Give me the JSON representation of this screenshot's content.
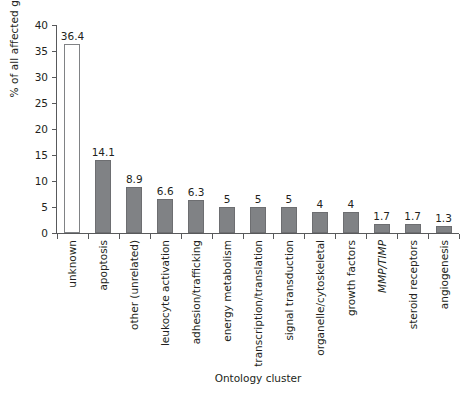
{
  "chart_data": {
    "type": "bar",
    "title": "",
    "xlabel": "Ontology cluster",
    "ylabel": "% of all affected genes",
    "ylim": [
      0,
      40
    ],
    "yticks": [
      0,
      5,
      10,
      15,
      20,
      25,
      30,
      35,
      40
    ],
    "ytick_labels": [
      "0",
      "5",
      "10",
      "15",
      "20",
      "25",
      "30",
      "35",
      "40"
    ],
    "grid": false,
    "legend": null,
    "categories": [
      "unknown",
      "apoptosis",
      "other (unrelated)",
      "leukocyte activation",
      "adhesion/trafficking",
      "energy metabolism",
      "transcription/translation",
      "signal transduction",
      "organelle/cytoskeletal",
      "growth factors",
      "MMP/TIMP",
      "steroid receptors",
      "angiogenesis"
    ],
    "values": [
      36.4,
      14.1,
      8.9,
      6.6,
      6.3,
      5,
      5,
      5,
      4,
      4,
      1.7,
      1.7,
      1.3
    ],
    "value_labels": [
      "36.4",
      "14.1",
      "8.9",
      "6.6",
      "6.3",
      "5",
      "5",
      "5",
      "4",
      "4",
      "1.7",
      "1.7",
      "1.3"
    ],
    "italic_categories": [
      "MMP/TIMP"
    ],
    "bar_styles": [
      "hollow",
      "filled",
      "filled",
      "filled",
      "filled",
      "filled",
      "filled",
      "filled",
      "filled",
      "filled",
      "filled",
      "filled",
      "filled"
    ],
    "colors": {
      "bar_fill": "#808285",
      "bar_edge": "#6d6e71",
      "hollow_fill": "#ffffff",
      "axis": "#58595b",
      "text": "#231f20",
      "background": "#ffffff"
    }
  }
}
